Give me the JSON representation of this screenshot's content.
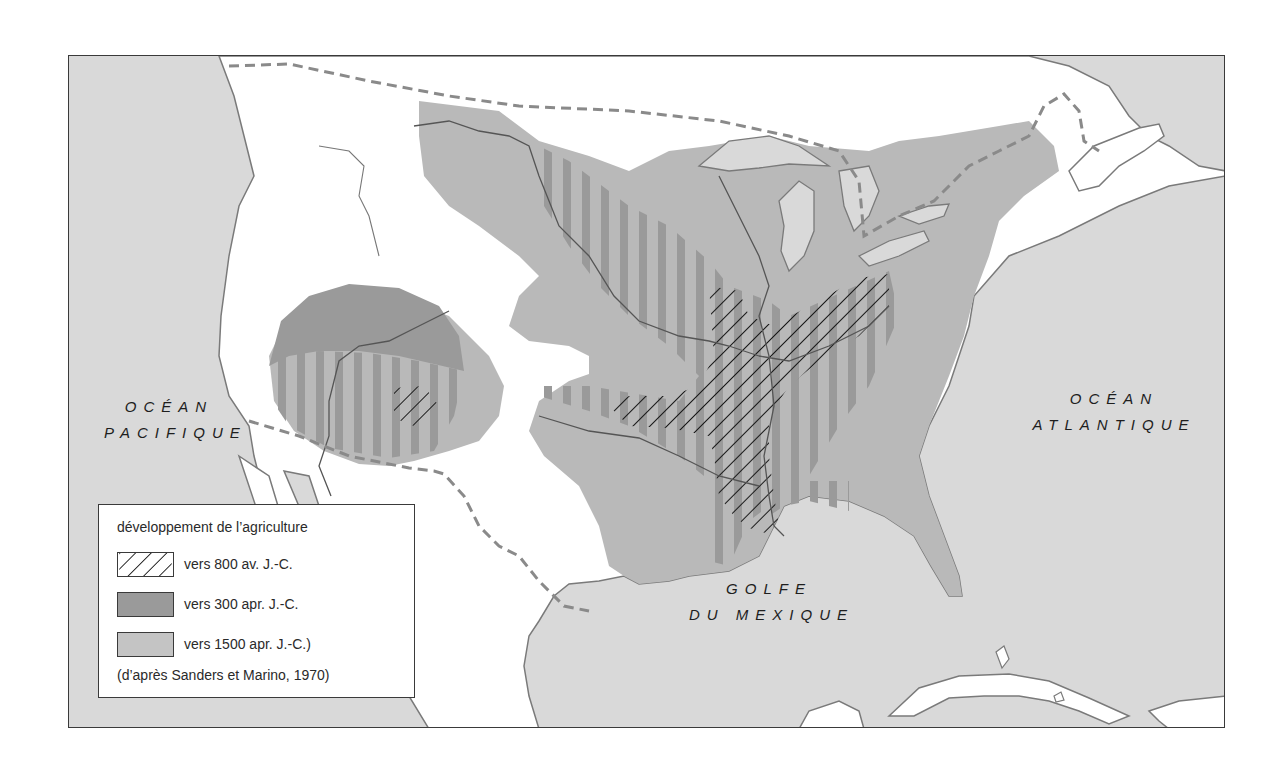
{
  "map": {
    "frame_colors": {
      "ocean": "#d9d9d9",
      "land_unaffected": "#ffffff",
      "zone_1500": "#b9b9b9",
      "zone_300": "#9a9a9a",
      "hatch_800": "#1a1a1a",
      "border_dashed": "#8a8a8a",
      "coast_line": "#7a7a7a"
    },
    "labels": {
      "pacific_line1": "OCÉAN",
      "pacific_line2": "PACIFIQUE",
      "atlantic_line1": "OCÉAN",
      "atlantic_line2": "ATLANTIQUE",
      "gulf_line1": "GOLFE",
      "gulf_line2": "DU MEXIQUE"
    }
  },
  "legend": {
    "title": "développement de l’agriculture",
    "items": [
      {
        "label": "vers 800 av. J.-C.",
        "pattern": "hatch"
      },
      {
        "label": "vers 300 apr. J.-C.",
        "pattern": "dark-grey"
      },
      {
        "label": "vers 1500 apr. J.-C.)",
        "pattern": "light-grey"
      }
    ],
    "source": "(d’après Sanders et Marino, 1970)"
  }
}
